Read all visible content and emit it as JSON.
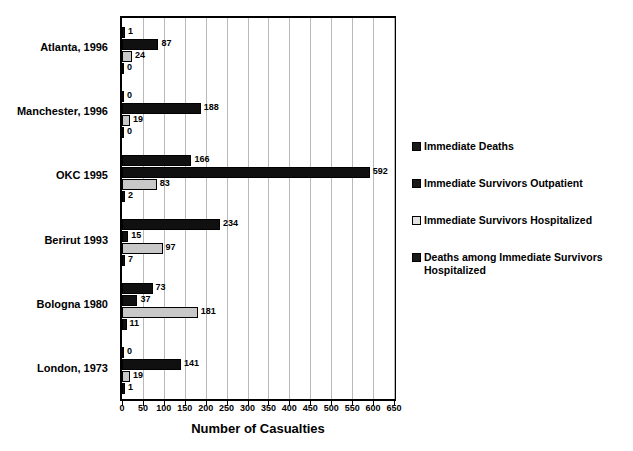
{
  "chart_data": {
    "type": "bar",
    "orientation": "horizontal",
    "title": "",
    "xlabel": "Number of Casualties",
    "ylabel": "",
    "xlim": [
      0,
      650
    ],
    "xticks": [
      0,
      50,
      100,
      150,
      200,
      250,
      300,
      350,
      400,
      450,
      500,
      550,
      600,
      650
    ],
    "grid": true,
    "grid_axis": "x",
    "legend_position": "right",
    "categories": [
      "Atlanta, 1996",
      "Manchester, 1996",
      "OKC 1995",
      "Berirut 1993",
      "Bologna 1980",
      "London, 1973"
    ],
    "series": [
      {
        "name": "Immediate Deaths",
        "color": "#101010",
        "values": [
          1,
          0,
          166,
          234,
          73,
          0
        ]
      },
      {
        "name": "Immediate Survivors Outpatient",
        "color": "#101010",
        "values": [
          87,
          188,
          592,
          15,
          37,
          141
        ]
      },
      {
        "name": "Immediate Survivors Hospitalized",
        "color": "#c8c8c8",
        "values": [
          24,
          19,
          83,
          97,
          181,
          19
        ]
      },
      {
        "name": "Deaths among Immediate Survivors Hospitalized",
        "color": "#101010",
        "values": [
          0,
          0,
          2,
          7,
          11,
          1
        ]
      }
    ]
  },
  "legend": {
    "items": [
      {
        "label": "Immediate Deaths",
        "swatch": "dark"
      },
      {
        "label": "Immediate Survivors Outpatient",
        "swatch": "dark"
      },
      {
        "label": "Immediate Survivors Hospitalized",
        "swatch": "light"
      },
      {
        "label": "Deaths among Immediate Survivors Hospitalized",
        "swatch": "dark"
      }
    ]
  },
  "axis": {
    "x_title": "Number of Casualties"
  }
}
